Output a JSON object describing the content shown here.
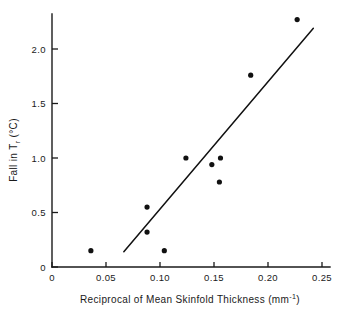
{
  "chart_data": {
    "type": "scatter",
    "title": "",
    "xlabel": "Reciprocal of Mean Skinfold Thickness   (mm⁻¹)",
    "xlabel_main": "Reciprocal of Mean Skinfold Thickness",
    "xlabel_units_open": "(mm",
    "xlabel_units_exp": "-1",
    "xlabel_units_close": ")",
    "ylabel": "Fall in Tᵣ  (°C)",
    "ylabel_main": "Fall in T",
    "ylabel_sub": "r",
    "ylabel_units": "(°C)",
    "xlim": [
      0,
      0.25
    ],
    "ylim": [
      0,
      2.27
    ],
    "xticks": [
      0,
      0.05,
      0.1,
      0.15,
      0.2,
      0.25
    ],
    "xticklabels": [
      "0",
      "0.05",
      "0.10",
      "0.15",
      "0.20",
      "0.25"
    ],
    "yticks": [
      0,
      0.5,
      1.0,
      1.5,
      2.0
    ],
    "yticklabels": [
      "0",
      "0.5",
      "1.0",
      "1.5",
      "2.0"
    ],
    "grid": false,
    "legend": null,
    "points": [
      {
        "x": 0.036,
        "y": 0.15
      },
      {
        "x": 0.088,
        "y": 0.32
      },
      {
        "x": 0.088,
        "y": 0.55
      },
      {
        "x": 0.104,
        "y": 0.15
      },
      {
        "x": 0.124,
        "y": 1.0
      },
      {
        "x": 0.148,
        "y": 0.94
      },
      {
        "x": 0.155,
        "y": 0.78
      },
      {
        "x": 0.156,
        "y": 1.0
      },
      {
        "x": 0.184,
        "y": 1.76
      },
      {
        "x": 0.227,
        "y": 2.27
      }
    ],
    "fit_line": {
      "x1": 0.0665,
      "y1": 0.14,
      "x2": 0.242,
      "y2": 2.19
    },
    "point_marker_radius": 2.6
  }
}
